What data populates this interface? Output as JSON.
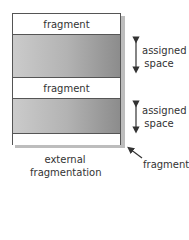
{
  "diagram": {
    "memory_block": {
      "bands": [
        {
          "type": "fragment",
          "label": "fragment"
        },
        {
          "type": "assigned",
          "label": ""
        },
        {
          "type": "fragment",
          "label": "fragment"
        },
        {
          "type": "assigned",
          "label": ""
        },
        {
          "type": "fragment",
          "label": ""
        }
      ]
    },
    "annotations": {
      "assigned_space_1": {
        "line1": "assigned",
        "line2": "space"
      },
      "assigned_space_2": {
        "line1": "assigned",
        "line2": "space"
      },
      "fragment_pointer": "fragment",
      "caption": {
        "line1": "external",
        "line2": "fragmentation"
      }
    },
    "colors": {
      "border": "#555555",
      "assigned_light": "#cbcbcb",
      "assigned_dark": "#8c8c8c",
      "shadow": "#bdbdbd"
    }
  }
}
